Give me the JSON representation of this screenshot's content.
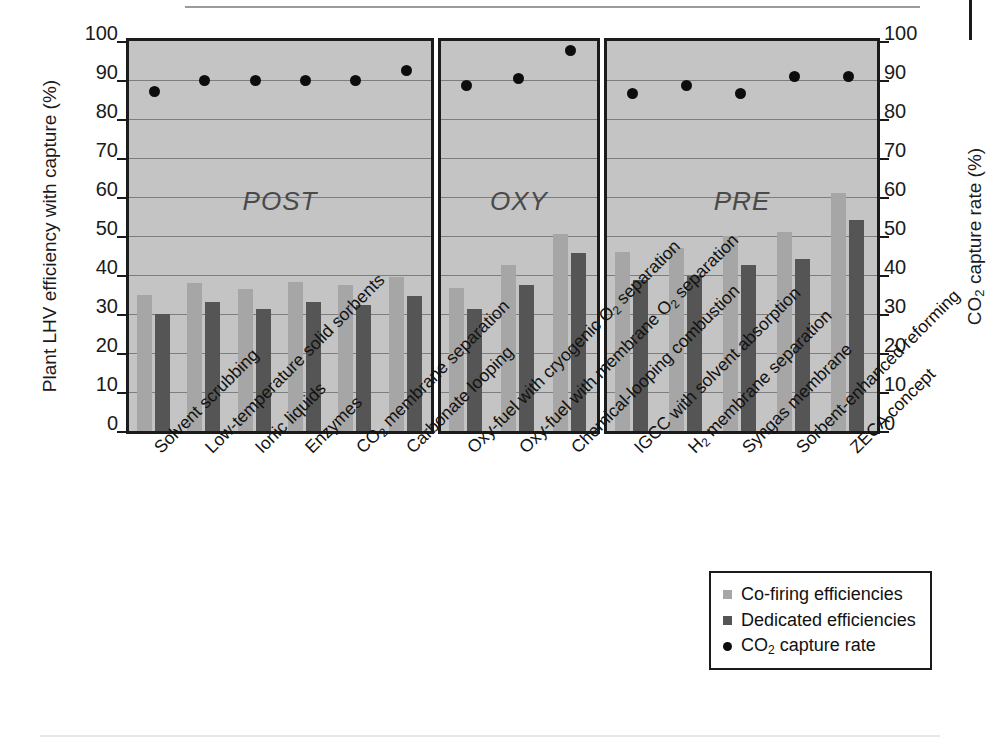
{
  "chart_data": {
    "type": "bar",
    "title": "",
    "xlabel": "",
    "ylabel": "Plant LHV efficiency with capture (%)",
    "y2label": "CO2 capture rate (%)",
    "ylim": [
      0,
      100
    ],
    "y2lim": [
      0,
      100
    ],
    "yticks": [
      0,
      10,
      20,
      30,
      40,
      50,
      60,
      70,
      80,
      90,
      100
    ],
    "y2ticks": [
      0,
      10,
      20,
      30,
      40,
      50,
      60,
      70,
      80,
      90,
      100
    ],
    "grid": true,
    "legend_position": "bottom-right",
    "panels": [
      {
        "name": "POST",
        "categories": [
          "Solvent scrubbing",
          "Low-temperature solid sorbents",
          "Ionic liquids",
          "Enzymes",
          "CO2 membrane separation",
          "Carbonate looping"
        ]
      },
      {
        "name": "OXY",
        "categories": [
          "Oxy-fuel with cryogenic O2 separation",
          "Oxy-fuel with membrane O2 separation",
          "Chemical-looping combustion"
        ]
      },
      {
        "name": "PRE",
        "categories": [
          "IGCC with solvent absorption",
          "H2 membrane separation",
          "Syngas membrane",
          "Sorbent-enhanced reforming",
          "ZECA concept"
        ]
      }
    ],
    "categories": [
      "Solvent scrubbing",
      "Low-temperature solid sorbents",
      "Ionic liquids",
      "Enzymes",
      "CO2 membrane separation",
      "Carbonate looping",
      "Oxy-fuel with cryogenic O2 separation",
      "Oxy-fuel with membrane O2 separation",
      "Chemical-looping combustion",
      "IGCC with solvent absorption",
      "H2 membrane separation",
      "Syngas membrane",
      "Sorbent-enhanced reforming",
      "ZECA concept"
    ],
    "series": [
      {
        "name": "Co-firing efficiencies",
        "color": "#a6a6a6",
        "values": [
          35,
          38,
          36.5,
          38.3,
          37.5,
          39.4,
          36.7,
          42.6,
          50.6,
          45.8,
          46.8,
          50,
          51,
          61
        ]
      },
      {
        "name": "Dedicated efficiencies",
        "color": "#555555",
        "values": [
          30,
          33,
          31.4,
          33.2,
          32.4,
          34.5,
          31.4,
          37.5,
          45.6,
          38.7,
          39.8,
          42.6,
          44,
          54
        ]
      },
      {
        "name": "CO2 capture rate",
        "color": "#0d0d0d",
        "marker": "circle",
        "values": [
          87,
          90,
          90,
          90,
          90,
          92.5,
          88.5,
          90.5,
          97.5,
          86.5,
          88.5,
          86.5,
          91,
          91
        ]
      }
    ]
  },
  "axes": {
    "left_title_main": "Plant LHV efficiency with capture (%)",
    "right_title_pre": "CO",
    "right_title_sub": "2",
    "right_title_post": " capture rate  (%)",
    "tick_labels": [
      "100",
      "90",
      "80",
      "70",
      "60",
      "50",
      "40",
      "30",
      "20",
      "10",
      "0"
    ]
  },
  "panel_labels": {
    "post": "POST",
    "oxy": "OXY",
    "pre": "PRE"
  },
  "x_labels": [
    {
      "text": "Solvent scrubbing",
      "pre": "Solvent scrubbing",
      "sub": "",
      "post": ""
    },
    {
      "text": "Low-temperature solid sorbents",
      "pre": "Low-temperature solid sorbents",
      "sub": "",
      "post": ""
    },
    {
      "text": "Ionic liquids",
      "pre": "Ionic liquids",
      "sub": "",
      "post": ""
    },
    {
      "text": "Enzymes",
      "pre": "Enzymes",
      "sub": "",
      "post": ""
    },
    {
      "text": "CO2 membrane separation",
      "pre": "CO",
      "sub": "2",
      "post": " membrane separation"
    },
    {
      "text": "Carbonate looping",
      "pre": "Carbonate looping",
      "sub": "",
      "post": ""
    },
    {
      "text": "Oxy-fuel with cryogenic O2 separation",
      "pre": "Oxy-fuel with cryogenic O",
      "sub": "2",
      "post": " separation"
    },
    {
      "text": "Oxy-fuel with membrane O2 separation",
      "pre": "Oxy-fuel with membrane O",
      "sub": "2",
      "post": " separation"
    },
    {
      "text": "Chemical-looping combustion",
      "pre": "Chemical-looping combustion",
      "sub": "",
      "post": ""
    },
    {
      "text": "IGCC with solvent absorption",
      "pre": "IGCC with solvent absorption",
      "sub": "",
      "post": ""
    },
    {
      "text": "H2 membrane separation",
      "pre": "H",
      "sub": "2",
      "post": " membrane separation"
    },
    {
      "text": "Syngas membrane",
      "pre": "Syngas membrane",
      "sub": "",
      "post": ""
    },
    {
      "text": "Sorbent-enhanced reforming",
      "pre": "Sorbent-enhanced reforming",
      "sub": "",
      "post": ""
    },
    {
      "text": "ZECA concept",
      "pre": "ZECA concept",
      "sub": "",
      "post": ""
    }
  ],
  "legend": {
    "items": [
      {
        "label": "Co-firing efficiencies",
        "marker": "square",
        "color": "#a6a6a6",
        "pre": "Co-firing efficiencies",
        "sub": "",
        "post": ""
      },
      {
        "label": "Dedicated efficiencies",
        "marker": "square",
        "color": "#555555",
        "pre": "Dedicated efficiencies",
        "sub": "",
        "post": ""
      },
      {
        "label": "CO2 capture rate",
        "marker": "circle",
        "color": "#0d0d0d",
        "pre": "CO",
        "sub": "2",
        "post": " capture rate"
      }
    ]
  },
  "colors": {
    "plot_background": "#c4c4c4",
    "frame": "#1b1b1b",
    "gridline": "#7d7d7d",
    "cofiring": "#a6a6a6",
    "dedicated": "#555555",
    "capture_dot": "#0d0d0d",
    "panel_label": "#4a4a4a"
  }
}
